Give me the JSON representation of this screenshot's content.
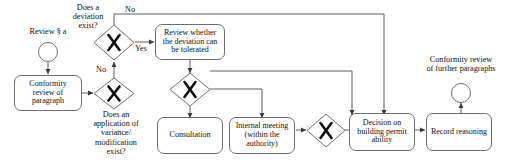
{
  "diagram": {
    "type": "bpmn-flowchart",
    "colors": {
      "stroke": "#6f6f6f",
      "line": "#5f5f5f",
      "text": "#111111",
      "background": "#ffffff"
    },
    "events": [
      {
        "id": "start",
        "name": "start-event",
        "label": "Review § a",
        "label_position": "above"
      },
      {
        "id": "end",
        "name": "end-event",
        "label": "Conformity review\nof further paragraphs",
        "label_position": "above"
      }
    ],
    "tasks": [
      {
        "id": "t1",
        "name": "conformity-review-of-paragraph",
        "label": "Conformity\nreview of\nparagraph"
      },
      {
        "id": "t2",
        "name": "review-whether-deviation-tolerated",
        "label": "Review whether\nthe deviation can\nbe tolerated"
      },
      {
        "id": "t3",
        "name": "consultation",
        "label": "Consultation"
      },
      {
        "id": "t4",
        "name": "internal-meeting",
        "label": "Internal meeting\n(within the\nauthority)"
      },
      {
        "id": "t5",
        "name": "decision-on-building-permit-ability",
        "label": "Decision on\nbuilding permit\nability"
      },
      {
        "id": "t6",
        "name": "record-reasoning",
        "label": "Record reasoning"
      }
    ],
    "gateways": [
      {
        "id": "g1",
        "name": "gateway-deviation-exists",
        "label": "Does a\ndeviation\nexist?",
        "label_position": "above-left",
        "symbol": "X"
      },
      {
        "id": "g2",
        "name": "gateway-application-variance-exists",
        "label": "Does an\napplication of\nvariance/\nmodification\nexist?",
        "label_position": "below",
        "symbol": "X"
      },
      {
        "id": "g3",
        "name": "gateway-split-consultation-meeting",
        "label": "",
        "symbol": "X"
      },
      {
        "id": "g4",
        "name": "gateway-merge-before-decision",
        "label": "",
        "symbol": "X"
      }
    ],
    "flow_labels": [
      {
        "id": "f1",
        "name": "flow-label-no-top",
        "label": "No"
      },
      {
        "id": "f2",
        "name": "flow-label-yes",
        "label": "Yes"
      },
      {
        "id": "f3",
        "name": "flow-label-no-left",
        "label": "No"
      }
    ]
  }
}
